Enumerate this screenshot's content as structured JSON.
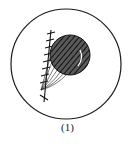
{
  "figure": {
    "caption": "(1)",
    "colors": {
      "stroke": "#1a1a1a",
      "fill_dark": "#3a3a3a",
      "background": "#ffffff"
    },
    "outer_circle": {
      "cx": 66,
      "cy": 64,
      "r": 55
    },
    "ball": {
      "cx": 70,
      "cy": 55,
      "r": 20
    },
    "hatched_line": {
      "x1": 51,
      "y1": 30,
      "x2": 44,
      "y2": 102,
      "ticks": 9
    }
  }
}
